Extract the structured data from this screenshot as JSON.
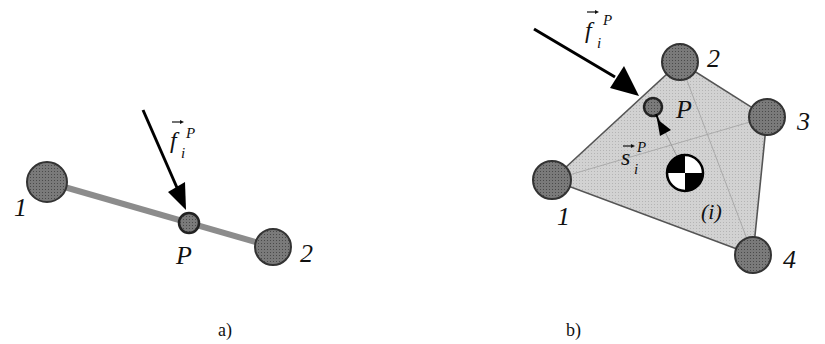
{
  "panel_a": {
    "caption": "a)",
    "nodes": [
      {
        "label": "1",
        "x": 47,
        "y": 182,
        "r": 20
      },
      {
        "label": "2",
        "x": 273,
        "y": 247,
        "r": 18
      }
    ],
    "point": {
      "label": "P",
      "x": 189,
      "y": 223,
      "r": 10
    },
    "force_label": {
      "base": "f",
      "sub": "i",
      "sup": "P"
    }
  },
  "panel_b": {
    "caption": "b)",
    "element_label": "(i)",
    "nodes": [
      {
        "label": "1",
        "x": 552,
        "y": 180,
        "r": 19
      },
      {
        "label": "2",
        "x": 680,
        "y": 62,
        "r": 18
      },
      {
        "label": "3",
        "x": 767,
        "y": 117,
        "r": 18
      },
      {
        "label": "4",
        "x": 753,
        "y": 255,
        "r": 18
      }
    ],
    "point": {
      "label": "P",
      "x": 653,
      "y": 107,
      "r": 10
    },
    "force_label": {
      "base": "f",
      "sub": "i",
      "sup": "P"
    },
    "offset_label": {
      "base": "s",
      "sub": "i",
      "sup": "P"
    },
    "center_of_gravity": {
      "x": 685,
      "y": 173,
      "r": 18
    }
  },
  "colors": {
    "node_fill": "#6a6a6a",
    "node_stroke": "#333333",
    "element_fill": "#cfcfcf",
    "bar": "#9a9a9a",
    "arrow": "#000000"
  }
}
